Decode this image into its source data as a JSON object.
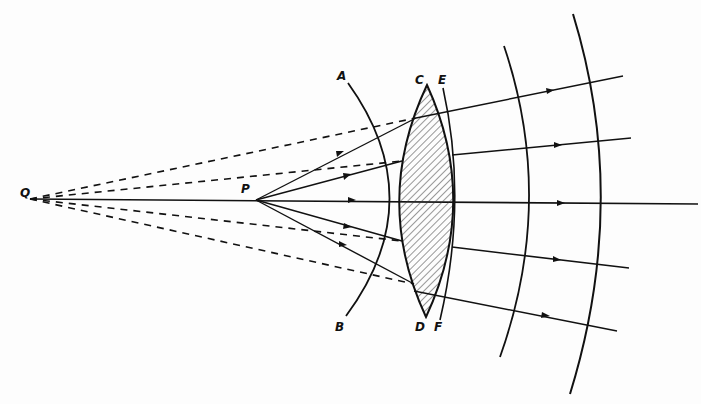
{
  "diagram": {
    "type": "optics-lens-refraction",
    "colors": {
      "ink": "#111111",
      "background": "#fdfdfd",
      "hatch": "#333333"
    },
    "labels": {
      "Q": "Q",
      "P": "P",
      "A": "A",
      "B": "B",
      "C": "C",
      "D": "D",
      "E": "E",
      "F": "F"
    },
    "points": {
      "Q": [
        30,
        199
      ],
      "P": [
        256,
        200
      ],
      "lens_top": [
        427,
        85
      ],
      "lens_bottom": [
        426,
        317
      ]
    }
  }
}
